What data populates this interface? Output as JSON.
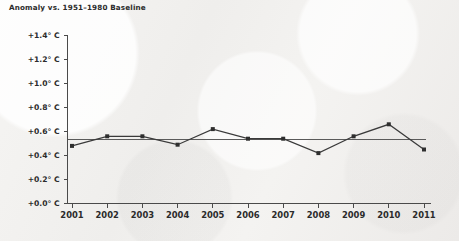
{
  "chart_data": {
    "type": "line",
    "title": "Anomaly vs. 1951–1980 Baseline",
    "xlabel": "",
    "ylabel": "",
    "x": [
      2001,
      2002,
      2003,
      2004,
      2005,
      2006,
      2007,
      2008,
      2009,
      2010,
      2011
    ],
    "categories": [
      "2001",
      "2002",
      "2003",
      "2004",
      "2005",
      "2006",
      "2007",
      "2008",
      "2009",
      "2010",
      "2011"
    ],
    "values": [
      0.48,
      0.56,
      0.56,
      0.49,
      0.62,
      0.54,
      0.54,
      0.42,
      0.56,
      0.66,
      0.45
    ],
    "series": [
      {
        "name": "Temperature anomaly",
        "values": [
          0.48,
          0.56,
          0.56,
          0.49,
          0.62,
          0.54,
          0.54,
          0.42,
          0.56,
          0.66,
          0.45
        ]
      }
    ],
    "reference_line": {
      "label": "",
      "value": 0.53
    },
    "ylim": [
      0.0,
      1.4
    ],
    "ytick_values": [
      0.0,
      0.2,
      0.4,
      0.6,
      0.8,
      1.0,
      1.2,
      1.4
    ],
    "ytick_labels": [
      "+0.0° C",
      "+0.2° C",
      "+0.4° C",
      "+0.6° C",
      "+0.8° C",
      "+1.0° C",
      "+1.2° C",
      "+1.4° C"
    ],
    "xtick_labels": [
      "2001",
      "2002",
      "2003",
      "2004",
      "2005",
      "2006",
      "2007",
      "2008",
      "2009",
      "2010",
      "2011"
    ],
    "grid": false,
    "legend": null,
    "legend_position": "none",
    "marker": "square",
    "colors": {
      "line": "#3a3a3a",
      "marker": "#2e2e2e",
      "axis": "#4a4a4a",
      "reference": "#5a5a5a",
      "text": "#2b2b2b",
      "background": "#f3f2f0"
    }
  }
}
